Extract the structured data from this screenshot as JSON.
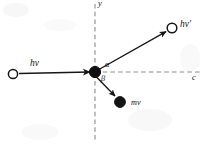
{
  "figure": {
    "background_color": "#ffffff",
    "stroke_color": "#161616",
    "axis_color": "#8a8a8a",
    "width": 205,
    "height": 148
  },
  "axes": {
    "vertical": {
      "label": "y",
      "style": "dashed",
      "x": 95,
      "y_top": 4,
      "y_bottom": 141
    },
    "horizontal": {
      "label": "c",
      "style": "dashed",
      "y": 72,
      "x_left": 95,
      "x_right": 201
    }
  },
  "vertex": {
    "name": "scattering-vertex",
    "x": 95,
    "y": 72,
    "radius": 5.6,
    "fill": "#111111"
  },
  "particles": [
    {
      "id": "incident-photon",
      "label": "hν",
      "marker": "open-circle",
      "marker_x": 13,
      "marker_y": 74,
      "marker_radius": 4.6,
      "arrow_from_x": 19,
      "arrow_from_y": 73,
      "arrow_to_x": 90,
      "arrow_to_y": 72
    },
    {
      "id": "scattered-photon",
      "label": "hν′",
      "marker": "open-circle",
      "marker_x": 172,
      "marker_y": 28,
      "marker_radius": 4.8,
      "arrow_from_x": 98,
      "arrow_from_y": 70,
      "arrow_to_x": 167,
      "arrow_to_y": 31
    },
    {
      "id": "recoil-electron",
      "label": "mv",
      "marker": "filled-circle",
      "marker_x": 120,
      "marker_y": 102,
      "marker_radius": 5.4,
      "arrow_from_x": 97,
      "arrow_from_y": 77,
      "arrow_to_x": 116,
      "arrow_to_y": 97
    }
  ],
  "angles": [
    {
      "id": "alpha",
      "label": "α",
      "between": "scattered-photon and horizontal axis"
    },
    {
      "id": "beta",
      "label": "β",
      "between": "recoil-electron and horizontal axis"
    }
  ]
}
